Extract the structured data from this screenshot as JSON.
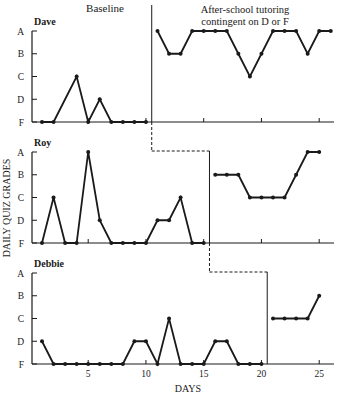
{
  "chart_data": {
    "type": "line",
    "title": "",
    "xlabel": "DAYS",
    "ylabel": "DAILY QUIZ GRADES",
    "phase_labels": {
      "baseline": "Baseline",
      "treatment_line1": "After-school tutoring",
      "treatment_line2": "contingent on D or F"
    },
    "x_ticks": [
      5,
      10,
      15,
      20,
      25
    ],
    "x_range": [
      0,
      26
    ],
    "y_ticks": [
      "A",
      "B",
      "C",
      "D",
      "F"
    ],
    "grade_values": {
      "A": 4,
      "B": 3,
      "C": 2,
      "D": 1,
      "F": 0
    },
    "grid": false,
    "line_color": "#1a1a1a",
    "panels": [
      {
        "name": "Dave",
        "phase_change_after_day": 10,
        "baseline": {
          "days": [
            1,
            2,
            4,
            5,
            6,
            7,
            8,
            9,
            10
          ],
          "grades": [
            "F",
            "F",
            "C",
            "F",
            "D",
            "F",
            "F",
            "F",
            "F"
          ]
        },
        "treatment": {
          "days": [
            11,
            12,
            13,
            14,
            15,
            16,
            17,
            18,
            19,
            20,
            21,
            22,
            23,
            24,
            25,
            26
          ],
          "grades": [
            "A",
            "B",
            "B",
            "A",
            "A",
            "A",
            "A",
            "B",
            "C",
            "B",
            "A",
            "A",
            "A",
            "B",
            "A",
            "A"
          ]
        }
      },
      {
        "name": "Roy",
        "phase_change_after_day": 15,
        "baseline": {
          "days": [
            1,
            2,
            3,
            4,
            5,
            6,
            7,
            8,
            9,
            10,
            11,
            12,
            13,
            14,
            15
          ],
          "grades": [
            "F",
            "C",
            "F",
            "F",
            "A",
            "D",
            "F",
            "F",
            "F",
            "F",
            "D",
            "D",
            "C",
            "F",
            "F"
          ]
        },
        "treatment": {
          "days": [
            16,
            17,
            18,
            19,
            20,
            21,
            22,
            23,
            24,
            25
          ],
          "grades": [
            "B",
            "B",
            "B",
            "C",
            "C",
            "C",
            "C",
            "B",
            "A",
            "A"
          ]
        }
      },
      {
        "name": "Debbie",
        "phase_change_after_day": 20,
        "baseline": {
          "days": [
            1,
            2,
            3,
            4,
            5,
            6,
            7,
            8,
            9,
            10,
            11,
            12,
            13,
            14,
            15,
            16,
            17,
            18,
            19,
            20
          ],
          "grades": [
            "D",
            "F",
            "F",
            "F",
            "F",
            "F",
            "F",
            "F",
            "D",
            "D",
            "F",
            "C",
            "F",
            "F",
            "F",
            "D",
            "D",
            "F",
            "F",
            "F"
          ]
        },
        "treatment": {
          "days": [
            21,
            22,
            23,
            24,
            25
          ],
          "grades": [
            "C",
            "C",
            "C",
            "C",
            "B"
          ]
        }
      }
    ]
  }
}
